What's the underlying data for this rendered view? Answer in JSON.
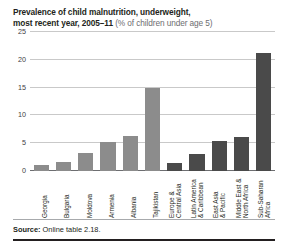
{
  "title": {
    "line1": "Prevalence of child malnutrition, underweight,",
    "line2_bold": "most recent year, 2005–11",
    "line2_sub": "(% of children under age 5)"
  },
  "footer": {
    "source_label": "Source:",
    "source_text": "Online table 2.18."
  },
  "colors": {
    "country_bar": "#8c8c8c",
    "region_bar": "#4a4a4a",
    "gridline": "#c9c9c9",
    "axis": "#6d6e71",
    "text": "#231f20",
    "subtext": "#6d6e71"
  },
  "chart_data": {
    "type": "bar",
    "title": "Prevalence of child malnutrition, underweight, most recent year, 2005–11 (% of children under age 5)",
    "xlabel": "",
    "ylabel": "",
    "ylim": [
      0,
      25
    ],
    "yticks": [
      0,
      5,
      10,
      15,
      20,
      25
    ],
    "ytick_labels": [
      "0",
      "5",
      "10",
      "15",
      "20",
      "25"
    ],
    "grid": true,
    "legend": "none",
    "categories": [
      "Georgia",
      "Bulgaria",
      "Moldova",
      "Armenia",
      "Albania",
      "Tajikistan",
      "Europe & Central Asia",
      "Latin America & Caribbean",
      "East Asia & Pacific",
      "Middle East & North Africa",
      "Sub-Saharan Africa"
    ],
    "category_lines": [
      [
        "Georgia",
        ""
      ],
      [
        "Bulgaria",
        ""
      ],
      [
        "Moldova",
        ""
      ],
      [
        "Armenia",
        ""
      ],
      [
        "Albania",
        ""
      ],
      [
        "Tajikistan",
        ""
      ],
      [
        "Europe &",
        "Central Asia"
      ],
      [
        "Latin America",
        "& Caribbean"
      ],
      [
        "East Asia",
        "& Pacific"
      ],
      [
        "Middle East &",
        "North Africa"
      ],
      [
        "Sub-Saharan",
        "Africa"
      ]
    ],
    "values": [
      1.1,
      1.6,
      3.2,
      5.3,
      6.3,
      15.0,
      1.4,
      3.0,
      5.4,
      6.1,
      21.3
    ],
    "group": [
      "country",
      "country",
      "country",
      "country",
      "country",
      "country",
      "region",
      "region",
      "region",
      "region",
      "region"
    ]
  }
}
